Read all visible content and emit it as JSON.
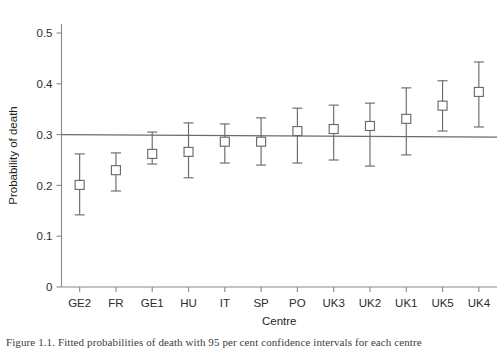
{
  "chart_data": {
    "type": "scatter",
    "title": "",
    "xlabel": "Centre",
    "ylabel": "Probability of death",
    "categories": [
      "GE2",
      "FR",
      "GE1",
      "HU",
      "IT",
      "SP",
      "PO",
      "UK3",
      "UK2",
      "UK1",
      "UK5",
      "UK4"
    ],
    "values": [
      0.201,
      0.23,
      0.262,
      0.266,
      0.286,
      0.286,
      0.307,
      0.311,
      0.317,
      0.331,
      0.357,
      0.384
    ],
    "error_low": [
      0.142,
      0.189,
      0.242,
      0.215,
      0.244,
      0.24,
      0.244,
      0.25,
      0.238,
      0.26,
      0.307,
      0.315
    ],
    "error_high": [
      0.262,
      0.264,
      0.305,
      0.323,
      0.321,
      0.333,
      0.352,
      0.358,
      0.362,
      0.392,
      0.406,
      0.443
    ],
    "marker": "open-square",
    "errorbar_style": "capped-vertical",
    "reference_line": {
      "label": "overall probability",
      "y_left": 0.3,
      "y_right": 0.295,
      "style": "solid"
    },
    "ylim": [
      0,
      0.53
    ],
    "ytick_labels": [
      "0",
      "0.1",
      "0.2",
      "0.3",
      "0.4",
      "0.5"
    ],
    "ytick_values": [
      0,
      0.1,
      0.2,
      0.3,
      0.4,
      0.5
    ],
    "grid": false,
    "legend": "none",
    "axis_color": "#8a8a8a",
    "marker_color": "#6b6b6b",
    "line_color": "#6b6b6b"
  },
  "caption": {
    "text": "Figure 1.1. Fitted probabilities of death with 95 per cent confidence intervals for each centre"
  }
}
